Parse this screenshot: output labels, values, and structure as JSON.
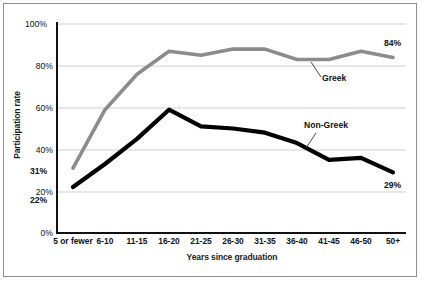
{
  "chart_data": {
    "type": "line",
    "title": "",
    "subtitle": "",
    "xlabel": "Years since graduation",
    "ylabel": "Participation rate",
    "categories": [
      "5 or fewer",
      "6-10",
      "11-15",
      "16-20",
      "21-25",
      "26-30",
      "31-35",
      "36-40",
      "41-45",
      "46-50",
      "50+"
    ],
    "ylim": [
      0,
      100
    ],
    "yticks": [
      "0%",
      "20%",
      "40%",
      "60%",
      "80%",
      "100%"
    ],
    "ytick_values": [
      0,
      20,
      40,
      60,
      80,
      100
    ],
    "grid": "horizontal",
    "legend": "inline-annotations",
    "series": [
      {
        "name": "Greek",
        "color": "#8c8c8c",
        "values": [
          31,
          59,
          76,
          87,
          85,
          88,
          88,
          83,
          83,
          87,
          84
        ]
      },
      {
        "name": "Non-Greek",
        "color": "#000000",
        "values": [
          22,
          33,
          45,
          59,
          51,
          50,
          48,
          43,
          35,
          36,
          29
        ]
      }
    ],
    "annotations": [
      {
        "text": "Greek",
        "series": "Greek"
      },
      {
        "text": "Non-Greek",
        "series": "Non-Greek"
      }
    ],
    "data_labels": [
      {
        "text": "31%",
        "series": "Greek",
        "category": "5 or fewer",
        "value": 31
      },
      {
        "text": "22%",
        "series": "Non-Greek",
        "category": "5 or fewer",
        "value": 22
      },
      {
        "text": "84%",
        "series": "Greek",
        "category": "50+",
        "value": 84
      },
      {
        "text": "29%",
        "series": "Non-Greek",
        "category": "50+",
        "value": 29
      }
    ]
  },
  "labels": {
    "ylabel": "Participation rate",
    "xlabel": "Years since graduation",
    "greek": "Greek",
    "nongreek": "Non-Greek",
    "v_31": "31%",
    "v_22": "22%",
    "v_84": "84%",
    "v_29": "29%",
    "y0": "0%",
    "y20": "20%",
    "y40": "40%",
    "y60": "60%",
    "y80": "80%",
    "y100": "100%",
    "x0": "5 or fewer",
    "x1": "6-10",
    "x2": "11-15",
    "x3": "16-20",
    "x4": "21-25",
    "x5": "26-30",
    "x6": "31-35",
    "x7": "36-40",
    "x8": "41-45",
    "x9": "46-50",
    "x10": "50+"
  }
}
